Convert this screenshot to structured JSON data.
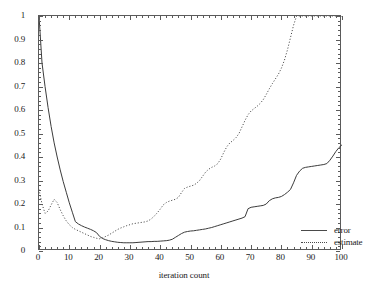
{
  "chart_data": {
    "type": "line",
    "title": "",
    "xlabel": "iteration count",
    "ylabel": "",
    "xlim": [
      0,
      100
    ],
    "ylim": [
      0,
      1
    ],
    "grid": false,
    "legend_position": "lower-right-inside",
    "xticks": [
      "0",
      "10",
      "20",
      "30",
      "40",
      "50",
      "60",
      "70",
      "80",
      "90",
      "100"
    ],
    "xtick_values": [
      0,
      10,
      20,
      30,
      40,
      50,
      60,
      70,
      80,
      90,
      100
    ],
    "yticks": [
      "0",
      "0.1",
      "0.2",
      "0.3",
      "0.4",
      "0.5",
      "0.6",
      "0.7",
      "0.8",
      "0.9",
      "1"
    ],
    "ytick_values": [
      0,
      0.1,
      0.2,
      0.3,
      0.4,
      0.5,
      0.6,
      0.7,
      0.8,
      0.9,
      1
    ],
    "series": [
      {
        "name": "error",
        "style": "solid",
        "color": "#3c3c3c",
        "x": [
          0,
          1,
          2,
          3,
          4,
          5,
          6,
          7,
          8,
          9,
          10,
          11,
          12,
          13,
          14,
          15,
          16,
          17,
          18,
          19,
          20,
          21,
          22,
          23,
          24,
          25,
          26,
          27,
          28,
          29,
          30,
          31,
          32,
          33,
          34,
          35,
          36,
          37,
          38,
          39,
          40,
          41,
          42,
          43,
          44,
          45,
          46,
          47,
          48,
          49,
          50,
          51,
          52,
          53,
          54,
          55,
          56,
          57,
          58,
          59,
          60,
          61,
          62,
          63,
          64,
          65,
          66,
          67,
          68,
          69,
          70,
          71,
          72,
          73,
          74,
          75,
          76,
          77,
          78,
          79,
          80,
          81,
          82,
          83,
          84,
          85,
          86,
          87,
          88,
          89,
          90,
          91,
          92,
          93,
          94,
          95,
          96,
          97,
          98,
          99,
          100
        ],
        "y": [
          1.0,
          0.8,
          0.7,
          0.61,
          0.53,
          0.46,
          0.4,
          0.345,
          0.295,
          0.25,
          0.205,
          0.165,
          0.125,
          0.115,
          0.108,
          0.102,
          0.097,
          0.092,
          0.086,
          0.078,
          0.062,
          0.053,
          0.048,
          0.044,
          0.041,
          0.039,
          0.037,
          0.036,
          0.035,
          0.035,
          0.035,
          0.035,
          0.036,
          0.037,
          0.038,
          0.039,
          0.04,
          0.04,
          0.041,
          0.041,
          0.042,
          0.043,
          0.044,
          0.046,
          0.05,
          0.058,
          0.066,
          0.074,
          0.08,
          0.083,
          0.085,
          0.086,
          0.088,
          0.09,
          0.092,
          0.094,
          0.097,
          0.1,
          0.104,
          0.108,
          0.112,
          0.116,
          0.12,
          0.124,
          0.128,
          0.132,
          0.136,
          0.14,
          0.146,
          0.18,
          0.186,
          0.188,
          0.19,
          0.192,
          0.194,
          0.2,
          0.214,
          0.222,
          0.226,
          0.228,
          0.232,
          0.24,
          0.25,
          0.262,
          0.29,
          0.322,
          0.34,
          0.352,
          0.356,
          0.358,
          0.36,
          0.362,
          0.364,
          0.366,
          0.368,
          0.372,
          0.386,
          0.404,
          0.424,
          0.44,
          0.452
        ]
      },
      {
        "name": "estimate",
        "style": "dotted",
        "color": "#4a4a4a",
        "x": [
          0,
          1,
          2,
          3,
          4,
          5,
          6,
          7,
          8,
          9,
          10,
          11,
          12,
          13,
          14,
          15,
          16,
          17,
          18,
          19,
          20,
          21,
          22,
          23,
          24,
          25,
          26,
          27,
          28,
          29,
          30,
          31,
          32,
          33,
          34,
          35,
          36,
          37,
          38,
          39,
          40,
          41,
          42,
          43,
          44,
          45,
          46,
          47,
          48,
          49,
          50,
          51,
          52,
          53,
          54,
          55,
          56,
          57,
          58,
          59,
          60,
          61,
          62,
          63,
          64,
          65,
          66,
          67,
          68,
          69,
          70,
          71,
          72,
          73,
          74,
          75,
          76,
          77,
          78,
          79,
          80,
          81,
          82,
          83,
          84,
          85,
          86,
          87,
          88,
          89,
          90,
          91,
          92,
          93,
          94,
          95,
          96,
          97,
          98,
          99,
          100
        ],
        "y": [
          0.262,
          0.2,
          0.16,
          0.17,
          0.196,
          0.22,
          0.206,
          0.176,
          0.15,
          0.128,
          0.112,
          0.1,
          0.092,
          0.086,
          0.08,
          0.074,
          0.068,
          0.062,
          0.058,
          0.054,
          0.052,
          0.056,
          0.062,
          0.068,
          0.076,
          0.084,
          0.092,
          0.098,
          0.103,
          0.108,
          0.112,
          0.116,
          0.118,
          0.12,
          0.122,
          0.124,
          0.128,
          0.136,
          0.148,
          0.162,
          0.178,
          0.196,
          0.206,
          0.212,
          0.216,
          0.22,
          0.228,
          0.248,
          0.266,
          0.272,
          0.276,
          0.28,
          0.288,
          0.3,
          0.318,
          0.336,
          0.348,
          0.356,
          0.362,
          0.372,
          0.392,
          0.42,
          0.444,
          0.46,
          0.47,
          0.482,
          0.5,
          0.528,
          0.556,
          0.58,
          0.596,
          0.606,
          0.616,
          0.628,
          0.644,
          0.666,
          0.69,
          0.712,
          0.732,
          0.752,
          0.778,
          0.812,
          0.856,
          0.908,
          0.96,
          1.0,
          1.0,
          1.0,
          1.0,
          1.0,
          1.0,
          1.0,
          1.0,
          1.0,
          1.0,
          1.0,
          1.0,
          1.0,
          1.0,
          1.0,
          1.0
        ]
      }
    ]
  },
  "legend": {
    "items": [
      {
        "label": "error"
      },
      {
        "label": "estimate"
      }
    ]
  }
}
